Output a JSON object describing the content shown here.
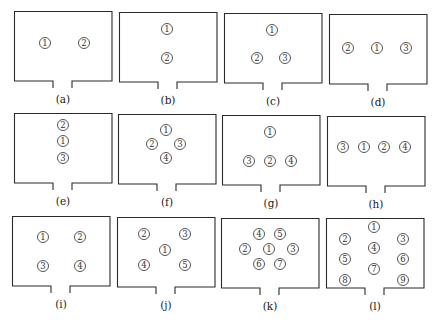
{
  "figure": {
    "panels": [
      {
        "id": "a",
        "caption": "(a)",
        "box": {
          "x": 14,
          "y": 11
        },
        "nodes": [
          {
            "label": "1",
            "x": 31,
            "y": 32
          },
          {
            "label": "2",
            "x": 70,
            "y": 32
          }
        ]
      },
      {
        "id": "b",
        "caption": "(b)",
        "box": {
          "x": 119,
          "y": 12
        },
        "nodes": [
          {
            "label": "1",
            "x": 48,
            "y": 17
          },
          {
            "label": "2",
            "x": 48,
            "y": 46
          }
        ]
      },
      {
        "id": "c",
        "caption": "(c)",
        "box": {
          "x": 224,
          "y": 13
        },
        "nodes": [
          {
            "label": "1",
            "x": 48,
            "y": 17
          },
          {
            "label": "2",
            "x": 33,
            "y": 45
          },
          {
            "label": "3",
            "x": 61,
            "y": 45
          }
        ]
      },
      {
        "id": "d",
        "caption": "(d)",
        "box": {
          "x": 329,
          "y": 14
        },
        "nodes": [
          {
            "label": "2",
            "x": 19,
            "y": 34
          },
          {
            "label": "1",
            "x": 48,
            "y": 34
          },
          {
            "label": "3",
            "x": 77,
            "y": 34
          }
        ]
      },
      {
        "id": "e",
        "caption": "(e)",
        "box": {
          "x": 14,
          "y": 113
        },
        "nodes": [
          {
            "label": "2",
            "x": 49,
            "y": 12
          },
          {
            "label": "1",
            "x": 49,
            "y": 28
          },
          {
            "label": "3",
            "x": 49,
            "y": 45
          }
        ]
      },
      {
        "id": "f",
        "caption": "(f)",
        "box": {
          "x": 118,
          "y": 114
        },
        "nodes": [
          {
            "label": "1",
            "x": 48,
            "y": 16
          },
          {
            "label": "2",
            "x": 34,
            "y": 30
          },
          {
            "label": "3",
            "x": 62,
            "y": 30
          },
          {
            "label": "4",
            "x": 48,
            "y": 44
          }
        ]
      },
      {
        "id": "g",
        "caption": "(g)",
        "box": {
          "x": 222,
          "y": 115
        },
        "nodes": [
          {
            "label": "1",
            "x": 48,
            "y": 17
          },
          {
            "label": "3",
            "x": 27,
            "y": 46
          },
          {
            "label": "2",
            "x": 48,
            "y": 46
          },
          {
            "label": "4",
            "x": 69,
            "y": 46
          }
        ]
      },
      {
        "id": "h",
        "caption": "(h)",
        "box": {
          "x": 327,
          "y": 116
        },
        "nodes": [
          {
            "label": "3",
            "x": 16,
            "y": 31
          },
          {
            "label": "1",
            "x": 37,
            "y": 31
          },
          {
            "label": "2",
            "x": 57,
            "y": 31
          },
          {
            "label": "4",
            "x": 78,
            "y": 31
          }
        ]
      },
      {
        "id": "i",
        "caption": "(i)",
        "box": {
          "x": 12,
          "y": 216
        },
        "nodes": [
          {
            "label": "1",
            "x": 31,
            "y": 21
          },
          {
            "label": "2",
            "x": 68,
            "y": 21
          },
          {
            "label": "3",
            "x": 31,
            "y": 50
          },
          {
            "label": "4",
            "x": 68,
            "y": 50
          }
        ]
      },
      {
        "id": "j",
        "caption": "(j)",
        "box": {
          "x": 117,
          "y": 217
        },
        "nodes": [
          {
            "label": "2",
            "x": 27,
            "y": 17
          },
          {
            "label": "3",
            "x": 68,
            "y": 17
          },
          {
            "label": "1",
            "x": 48,
            "y": 33
          },
          {
            "label": "4",
            "x": 27,
            "y": 48
          },
          {
            "label": "5",
            "x": 68,
            "y": 48
          }
        ]
      },
      {
        "id": "k",
        "caption": "(k)",
        "box": {
          "x": 221,
          "y": 218
        },
        "nodes": [
          {
            "label": "4",
            "x": 38,
            "y": 16
          },
          {
            "label": "5",
            "x": 59,
            "y": 16
          },
          {
            "label": "2",
            "x": 24,
            "y": 31
          },
          {
            "label": "1",
            "x": 48,
            "y": 31
          },
          {
            "label": "3",
            "x": 72,
            "y": 31
          },
          {
            "label": "6",
            "x": 38,
            "y": 46
          },
          {
            "label": "7",
            "x": 59,
            "y": 46
          }
        ]
      },
      {
        "id": "l",
        "caption": "(l)",
        "box": {
          "x": 326,
          "y": 218
        },
        "nodes": [
          {
            "label": "1",
            "x": 48,
            "y": 9
          },
          {
            "label": "2",
            "x": 19,
            "y": 21
          },
          {
            "label": "3",
            "x": 77,
            "y": 21
          },
          {
            "label": "4",
            "x": 48,
            "y": 30
          },
          {
            "label": "5",
            "x": 19,
            "y": 41
          },
          {
            "label": "6",
            "x": 77,
            "y": 41
          },
          {
            "label": "7",
            "x": 48,
            "y": 51
          },
          {
            "label": "8",
            "x": 19,
            "y": 62
          },
          {
            "label": "9",
            "x": 77,
            "y": 62
          }
        ]
      }
    ],
    "room_style": {
      "stroke": "#2b2b2b",
      "width": 98,
      "height": 70,
      "door_left": 39,
      "door_right": 58,
      "door_depth": 7
    }
  }
}
